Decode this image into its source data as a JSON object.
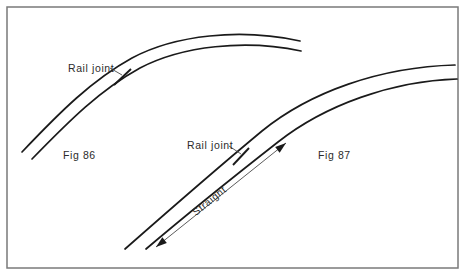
{
  "figure": {
    "background_color": "#ffffff",
    "ink_color": "#1a1a1a",
    "frame_color": "#7a7a7a",
    "frame": {
      "x": 7,
      "y": 7,
      "width": 451,
      "height": 261
    }
  },
  "diagrams": [
    {
      "id": "fig-86",
      "caption": "Fig 86",
      "caption_x": 63,
      "caption_y": 159,
      "annotation": "Rail joint",
      "annotation_x": 68,
      "annotation_y": 72,
      "description": "Curved track with rail joint on the curve",
      "outer_rail_path": "M 22,152 C 60,112 92,80 132,58 C 175,35 240,28 300,41",
      "inner_rail_path": "M 32,159 C 70,120 100,90 140,68 C 182,46 245,39 301,51",
      "joint_tick": {
        "x1": 114,
        "y1": 85,
        "x2": 131,
        "y2": 69
      },
      "leader": {
        "x1": 110,
        "y1": 68,
        "x2": 122,
        "y2": 75
      }
    },
    {
      "id": "fig-87",
      "caption": "Fig 87",
      "caption_x": 318,
      "caption_y": 159,
      "annotation": "Rail joint",
      "annotation_x": 187,
      "annotation_y": 149,
      "description": "Straight track leading into a curve with the rail joint placed on the straight",
      "outer_rail_path": "M 125,249 C 175,205 215,170 262,131 C 310,92 380,67 455,65",
      "inner_rail_path": "M 146,249 C 192,210 232,178 278,142 C 325,105 392,81 457,79",
      "joint_tick": {
        "x1": 233,
        "y1": 165,
        "x2": 249,
        "y2": 148
      },
      "leader": {
        "x1": 229,
        "y1": 146,
        "x2": 241,
        "y2": 154
      }
    }
  ],
  "dimension": {
    "label": "Straight",
    "label_x": 196,
    "label_y": 216,
    "label_rotation": -39,
    "line": {
      "x1": 156,
      "y1": 247,
      "x2": 286,
      "y2": 143
    },
    "start_arrowhead": true,
    "end_arrowhead": true
  }
}
